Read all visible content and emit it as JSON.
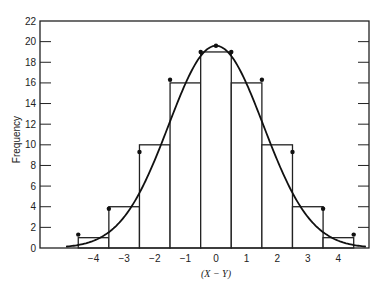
{
  "chart_data": {
    "type": "bar",
    "title": "",
    "xlabel": "(X − Y)",
    "ylabel": "Frequency",
    "xlim": [
      -5.75,
      5.0
    ],
    "ylim": [
      0,
      22
    ],
    "grid": false,
    "legend": "none",
    "x_ticks": [
      -4,
      -3,
      -2,
      -1,
      0,
      1,
      2,
      3,
      4
    ],
    "x_tick_labels": [
      "−4",
      "−3",
      "−2",
      "−1",
      "0",
      "1",
      "2",
      "3",
      "4"
    ],
    "y_ticks": [
      0,
      2,
      4,
      6,
      8,
      10,
      12,
      14,
      16,
      18,
      20,
      22
    ],
    "y_tick_labels": [
      "0",
      "2",
      "4",
      "6",
      "8",
      "10",
      "12",
      "14",
      "16",
      "18",
      "20",
      "22"
    ],
    "categories": [
      -4,
      -3,
      -2,
      -1,
      0,
      1,
      2,
      3,
      4
    ],
    "values": [
      1,
      4,
      10,
      16,
      19,
      16,
      10,
      4,
      1
    ],
    "fitted_curve": {
      "type": "normal",
      "peak": 19.6,
      "mean": 0,
      "sd": 1.55,
      "x_range": [
        -4.9,
        4.9
      ]
    },
    "curve_points": [
      {
        "x": -4.5,
        "y": 1.3
      },
      {
        "x": -3.5,
        "y": 3.8
      },
      {
        "x": -2.5,
        "y": 9.3
      },
      {
        "x": -1.5,
        "y": 16.3
      },
      {
        "x": -0.5,
        "y": 19.0
      },
      {
        "x": 0,
        "y": 19.6
      },
      {
        "x": 0.5,
        "y": 19.0
      },
      {
        "x": 1.5,
        "y": 16.3
      },
      {
        "x": 2.5,
        "y": 9.3
      },
      {
        "x": 3.5,
        "y": 3.8
      },
      {
        "x": 4.5,
        "y": 1.3
      }
    ]
  }
}
